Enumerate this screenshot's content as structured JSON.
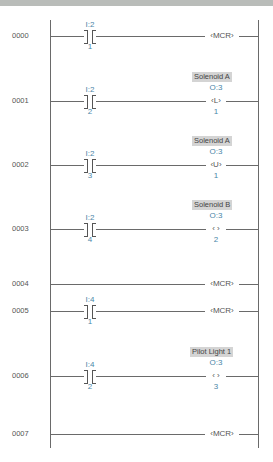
{
  "rungs": [
    {
      "num": "0000",
      "contact": {
        "file": "I:2",
        "bit": "1"
      },
      "coil": {
        "type": "MCR",
        "text": "‹MCR›"
      }
    },
    {
      "num": "0001",
      "contact": {
        "file": "I:2",
        "bit": "2"
      },
      "coil": {
        "type": "L",
        "text": "‹L›",
        "file": "O:3",
        "bit": "1",
        "label": "Solenoid A"
      }
    },
    {
      "num": "0002",
      "contact": {
        "file": "I:2",
        "bit": "3"
      },
      "coil": {
        "type": "U",
        "text": "‹U›",
        "file": "O:3",
        "bit": "1",
        "label": "Solenoid A"
      }
    },
    {
      "num": "0003",
      "contact": {
        "file": "I:2",
        "bit": "4"
      },
      "coil": {
        "type": "OTE",
        "text": "‹ ›",
        "file": "O:3",
        "bit": "2",
        "label": "Solenoid B"
      }
    },
    {
      "num": "0004",
      "coil": {
        "type": "MCR",
        "text": "‹MCR›"
      }
    },
    {
      "num": "0005",
      "contact": {
        "file": "I:4",
        "bit": "1"
      },
      "coil": {
        "type": "MCR",
        "text": "‹MCR›"
      }
    },
    {
      "num": "0006",
      "contact": {
        "file": "I:4",
        "bit": "2"
      },
      "coil": {
        "type": "OTE",
        "text": "‹ ›",
        "file": "O:3",
        "bit": "3",
        "label": "Pilot Light 1"
      }
    },
    {
      "num": "0007",
      "coil": {
        "type": "MCR",
        "text": "‹MCR›"
      }
    }
  ],
  "colors": {
    "address": "#4a86a8",
    "wire": "#6a6a6a",
    "label_bg": "#d4d4d4",
    "top_band": "#b9bcb9"
  }
}
